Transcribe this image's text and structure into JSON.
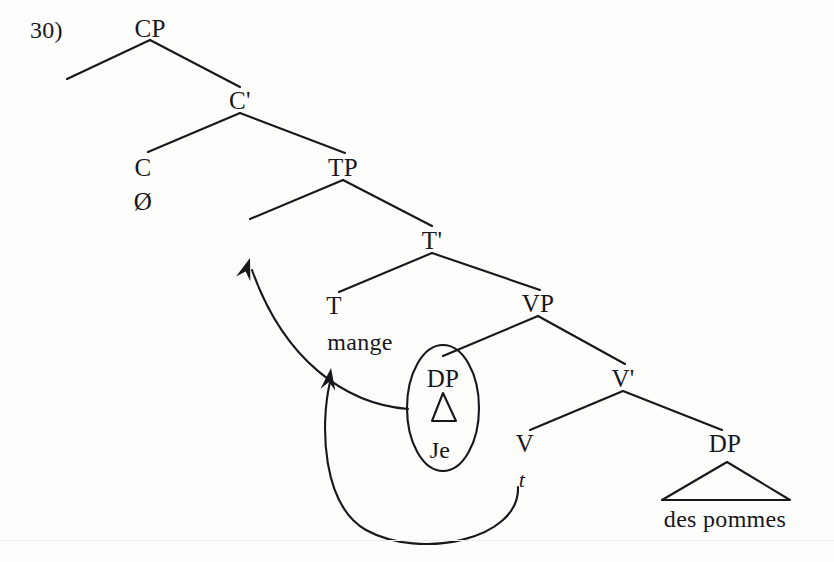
{
  "figure": {
    "example_number": "30)",
    "kind": "syntax-tree-diagram",
    "language_example": "Je mange des pommes",
    "ink_color": "#17171c",
    "background_color": "#fdfdfc"
  },
  "nodes": {
    "cp": {
      "label": "CP",
      "x": 150,
      "y": 28
    },
    "cbar": {
      "label": "C'",
      "x": 240,
      "y": 100
    },
    "c_head": {
      "label": "C",
      "x": 143,
      "y": 167
    },
    "c_null": {
      "label": "Ø",
      "x": 143,
      "y": 201
    },
    "tp": {
      "label": "TP",
      "x": 343,
      "y": 167
    },
    "tbar": {
      "label": "T'",
      "x": 432,
      "y": 240
    },
    "t_head": {
      "label": "T",
      "x": 334,
      "y": 305
    },
    "t_word": {
      "label": "mange",
      "x": 360,
      "y": 342
    },
    "vp": {
      "label": "VP",
      "x": 538,
      "y": 303
    },
    "dp_subject": {
      "label": "DP",
      "x": 443,
      "y": 378
    },
    "dp_subject_word": {
      "label": "Je",
      "x": 440,
      "y": 450
    },
    "vbar": {
      "label": "V'",
      "x": 623,
      "y": 378
    },
    "v_head": {
      "label": "V",
      "x": 525,
      "y": 443
    },
    "v_trace": {
      "label": "t",
      "x": 522,
      "y": 480
    },
    "dp_object": {
      "label": "DP",
      "x": 725,
      "y": 443
    },
    "dp_object_word": {
      "label": "des pommes",
      "x": 725,
      "y": 519
    }
  },
  "branches": [
    {
      "name": "cp-to-empty-spec",
      "from": [
        150,
        40
      ],
      "to": [
        67,
        79
      ]
    },
    {
      "name": "cp-to-cbar",
      "from": [
        150,
        40
      ],
      "to": [
        240,
        87
      ]
    },
    {
      "name": "cbar-to-c",
      "from": [
        240,
        113
      ],
      "to": [
        148,
        152
      ]
    },
    {
      "name": "cbar-to-tp",
      "from": [
        240,
        113
      ],
      "to": [
        345,
        153
      ]
    },
    {
      "name": "tp-to-empty-spec",
      "from": [
        343,
        180
      ],
      "to": [
        250,
        219
      ]
    },
    {
      "name": "tp-to-tbar",
      "from": [
        343,
        180
      ],
      "to": [
        432,
        226
      ]
    },
    {
      "name": "tbar-to-t",
      "from": [
        432,
        253
      ],
      "to": [
        339,
        292
      ]
    },
    {
      "name": "tbar-to-vp",
      "from": [
        432,
        253
      ],
      "to": [
        540,
        290
      ]
    },
    {
      "name": "vp-to-dp-subject",
      "from": [
        538,
        316
      ],
      "to": [
        443,
        356
      ]
    },
    {
      "name": "vp-to-vbar",
      "from": [
        538,
        316
      ],
      "to": [
        625,
        364
      ]
    },
    {
      "name": "vbar-to-v",
      "from": [
        623,
        391
      ],
      "to": [
        530,
        430
      ]
    },
    {
      "name": "vbar-to-dp-object",
      "from": [
        623,
        391
      ],
      "to": [
        722,
        430
      ]
    }
  ],
  "triangles": [
    {
      "name": "dp-subject-triangle",
      "apex": [
        443,
        393
      ],
      "left": [
        432,
        421
      ],
      "right": [
        456,
        421
      ]
    },
    {
      "name": "dp-object-triangle",
      "apex": [
        727,
        462
      ],
      "left": [
        662,
        500
      ],
      "right": [
        790,
        500
      ]
    }
  ],
  "ellipse": {
    "name": "dp-subject-circle",
    "cx": 443,
    "cy": 408,
    "rx": 36,
    "ry": 63
  },
  "movement_arrows": [
    {
      "name": "subject-raising-arrow",
      "description": "DP subject moves from Spec,VP to Spec,TP",
      "path": "M 408 409 C 345 404 284 360 252 270",
      "arrow_at": [
        250,
        258
      ],
      "arrow_angle": -72
    },
    {
      "name": "object-trace-arrow",
      "description": "object trace links back to Spec,VP region",
      "path": "M 518 487 C 520 540 420 560 366 530 C 322 505 320 425 330 382",
      "arrow_at": [
        331,
        368
      ],
      "arrow_angle": -82
    }
  ],
  "artifacts": {
    "scanline_y": 540
  }
}
